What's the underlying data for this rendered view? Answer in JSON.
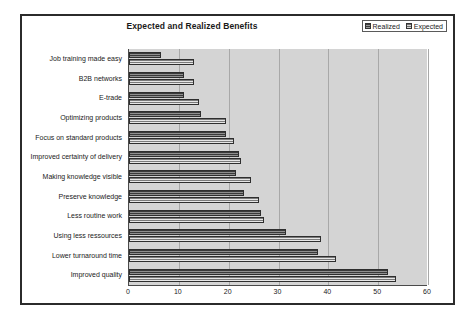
{
  "chart_data": {
    "type": "bar",
    "orientation": "horizontal",
    "title": "Expected and Realized Benefits",
    "xlabel": "",
    "ylabel": "",
    "xlim": [
      0,
      60
    ],
    "xticks": [
      0,
      10,
      20,
      30,
      40,
      50,
      60
    ],
    "grid": true,
    "legend_position": "top-right",
    "plot_background": "#d4d4d4",
    "categories": [
      "Job training made easy",
      "B2B networks",
      "E-trade",
      "Optimizing products",
      "Focus on standard products",
      "Improved certainty of delivery",
      "Making knowledge visible",
      "Preserve knowledge",
      "Less routine work",
      "Using less ressources",
      "Lower turnaround time",
      "Improved quality"
    ],
    "series": [
      {
        "name": "Realized",
        "color": "#3a3a3a",
        "values": [
          6.5,
          11,
          11,
          14.5,
          19.5,
          22,
          21.5,
          23,
          26.5,
          31.5,
          38,
          52
        ]
      },
      {
        "name": "Expected",
        "color": "#e6e6e6",
        "values": [
          13,
          13,
          14,
          19.5,
          21,
          22.5,
          24.5,
          26,
          27,
          38.5,
          41.5,
          53.5
        ]
      }
    ]
  },
  "legend": {
    "entries": [
      {
        "label": "Realized"
      },
      {
        "label": "Expected"
      }
    ]
  }
}
